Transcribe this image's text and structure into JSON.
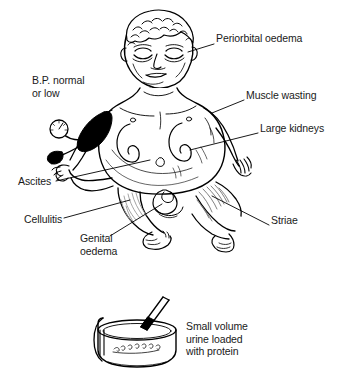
{
  "figure": {
    "background_color": "#ffffff",
    "ink_color": "#000000"
  },
  "labels": [
    {
      "id": "periorbital-oedema",
      "text": "Periorbital oedema",
      "x": 216,
      "y": 38,
      "align": "left"
    },
    {
      "id": "bp-normal-or-low",
      "text": "B.P. normal\nor low",
      "x": 32,
      "y": 80,
      "align": "left"
    },
    {
      "id": "muscle-wasting",
      "text": "Muscle wasting",
      "x": 246,
      "y": 95,
      "align": "left"
    },
    {
      "id": "large-kidneys",
      "text": "Large kidneys",
      "x": 260,
      "y": 128,
      "align": "left"
    },
    {
      "id": "ascites",
      "text": "Ascites",
      "x": 18,
      "y": 181,
      "align": "left"
    },
    {
      "id": "cellulitis",
      "text": "Cellulitis",
      "x": 24,
      "y": 219,
      "align": "left"
    },
    {
      "id": "genital-oedema",
      "text": "Genital\noedema",
      "x": 80,
      "y": 238,
      "align": "left"
    },
    {
      "id": "striae",
      "text": "Striae",
      "x": 271,
      "y": 220,
      "align": "left"
    },
    {
      "id": "small-volume-urine",
      "text": "Small volume\nurine loaded\nwith protein",
      "x": 186,
      "y": 326,
      "align": "left"
    }
  ],
  "illustration": {
    "subject": "infant-with-nephrotic-syndrome",
    "parts": [
      "head-with-curly-hair",
      "puffy-face",
      "distended-abdomen",
      "left-kidney-outline",
      "right-kidney-outline",
      "blood-pressure-cuff",
      "blood-pressure-gauge",
      "blood-pressure-bulb",
      "left-leg-with-cellulitis",
      "right-leg-with-striae",
      "genitals-with-oedema",
      "left-arm",
      "right-arm",
      "left-foot",
      "right-foot"
    ],
    "urine_specimen": {
      "name": "urine-sample-pot",
      "contents": "dipstick-in-pot"
    }
  }
}
